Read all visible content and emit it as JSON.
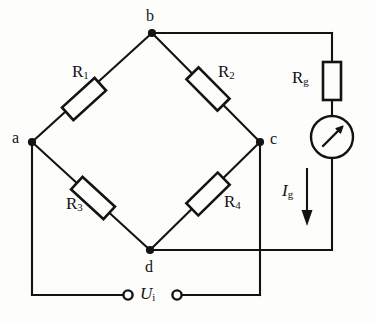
{
  "figure": {
    "background_color": "#fdfdfb",
    "stroke_color": "#131313"
  },
  "nodes": [
    {
      "id": "b",
      "label": "b",
      "x": 152,
      "y": 33
    },
    {
      "id": "a",
      "label": "a",
      "x": 32,
      "y": 142
    },
    {
      "id": "c",
      "label": "c",
      "x": 260,
      "y": 142
    },
    {
      "id": "d",
      "label": "d",
      "x": 150,
      "y": 250
    }
  ],
  "resistors": [
    {
      "id": "R1",
      "label": "R",
      "sub": "1",
      "branch": "a-b"
    },
    {
      "id": "R2",
      "label": "R",
      "sub": "2",
      "branch": "b-c"
    },
    {
      "id": "R3",
      "label": "R",
      "sub": "3",
      "branch": "a-d"
    },
    {
      "id": "R4",
      "label": "R",
      "sub": "4",
      "branch": "d-c"
    },
    {
      "id": "Rg",
      "label": "R",
      "sub": "g",
      "branch": "galvanometer"
    }
  ],
  "meter": {
    "name": "galvanometer",
    "symbol": "needle-arrow"
  },
  "current": {
    "label": "I",
    "sub": "g",
    "direction": "down"
  },
  "source": {
    "label": "U",
    "sub": "i",
    "terminals": 2
  }
}
